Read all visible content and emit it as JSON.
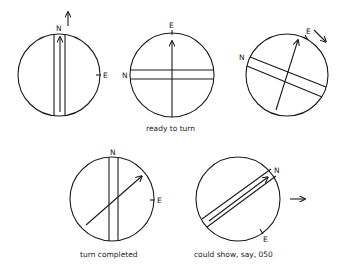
{
  "figure": {
    "type": "compass-turning-diagram",
    "ink_color": "#1a1a1a",
    "background": "#ffffff",
    "panels": [
      {
        "id": "initial",
        "caption": "",
        "labels": {
          "north": "N",
          "east": "E"
        },
        "note": "needle and orienting lines aligned north, arrow points up"
      },
      {
        "id": "ready-to-turn",
        "caption": "ready to turn",
        "labels": {
          "north": "N",
          "east": "E"
        },
        "note": "dial rotated so N at left, E at top"
      },
      {
        "id": "turning",
        "caption": "",
        "labels": {
          "north": "N",
          "east": "E"
        },
        "note": "dial rotating clockwise"
      },
      {
        "id": "turn-completed",
        "caption": "turn completed",
        "labels": {
          "north": "N",
          "east": "E"
        },
        "note": "orienting lines back north, arrow shows new heading"
      },
      {
        "id": "could-show",
        "caption": "could show, say, 050",
        "labels": {
          "north": "N",
          "east": "E"
        },
        "note": "heading 050"
      }
    ]
  }
}
